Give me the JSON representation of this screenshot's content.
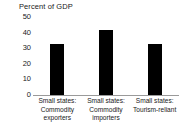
{
  "chart_data": {
    "type": "bar",
    "title": "Percent of GDP",
    "xlabel": "",
    "ylabel": "",
    "ylim": [
      0,
      50
    ],
    "yticks": [
      0,
      10,
      20,
      30,
      40,
      50
    ],
    "grid": false,
    "legend": false,
    "bar_color": "#000000",
    "axis_color": "#9a9a9a",
    "categories": [
      "Small states: Commodity exporters",
      "Small states: Commodity importers",
      "Small states: Tourism-reliant"
    ],
    "category_lines": [
      [
        "Small states:",
        "Commodity",
        "exporters"
      ],
      [
        "Small states:",
        "Commodity",
        "importers"
      ],
      [
        "Small states:",
        "Tourism-reliant"
      ]
    ],
    "values": [
      32.5,
      41.5,
      32.5
    ]
  }
}
